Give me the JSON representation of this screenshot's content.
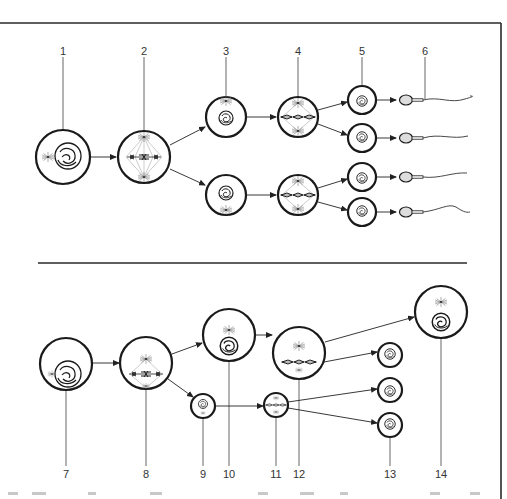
{
  "figure": {
    "top_panel": {
      "name": "spermatogenesis",
      "labels": [
        "1",
        "2",
        "3",
        "4",
        "5",
        "6"
      ],
      "stages": [
        {
          "label": "1",
          "description": "primary spermatocyte (interphase nucleus)"
        },
        {
          "label": "2",
          "description": "first meiotic division (metaphase I)"
        },
        {
          "label": "3",
          "description": "secondary spermatocytes"
        },
        {
          "label": "4",
          "description": "second meiotic division (metaphase II)"
        },
        {
          "label": "5",
          "description": "spermatids"
        },
        {
          "label": "6",
          "description": "spermatozoa"
        }
      ]
    },
    "bottom_panel": {
      "name": "oogenesis",
      "labels": [
        "7",
        "8",
        "9",
        "10",
        "11",
        "12",
        "13",
        "14"
      ],
      "stages": [
        {
          "label": "7",
          "description": "primary oocyte"
        },
        {
          "label": "8",
          "description": "first meiotic division"
        },
        {
          "label": "9",
          "description": "first polar body"
        },
        {
          "label": "10",
          "description": "secondary oocyte"
        },
        {
          "label": "11",
          "description": "division of first polar body"
        },
        {
          "label": "12",
          "description": "second meiotic division"
        },
        {
          "label": "13",
          "description": "polar bodies"
        },
        {
          "label": "14",
          "description": "ovum"
        }
      ]
    },
    "colors": {
      "line": "#1a1a1a",
      "leader": "#555555",
      "label": "#333333",
      "background": "#ffffff"
    }
  }
}
